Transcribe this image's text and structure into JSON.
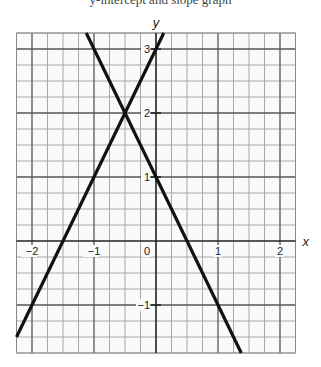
{
  "header": {
    "cutoff_text": "y-intercept and slope graph"
  },
  "chart_data": {
    "type": "line",
    "title": "",
    "xlabel": "x",
    "ylabel": "y",
    "xlim": [
      -2.25,
      2.25
    ],
    "ylim": [
      -1.75,
      3.25
    ],
    "grid": true,
    "grid_minor_step": 0.25,
    "grid_major_step": 1,
    "x_ticks": [
      -2,
      -1,
      0,
      1,
      2
    ],
    "x_tick_labels": [
      "−2",
      "−1",
      "0",
      "1",
      "2"
    ],
    "y_ticks": [
      -1,
      1,
      2,
      3
    ],
    "y_tick_labels": [
      "−1",
      "1",
      "2",
      "3"
    ],
    "series": [
      {
        "name": "y = 2x + 3",
        "slope": 2,
        "intercept": 3,
        "points": [
          [
            -2.25,
            -1.5
          ],
          [
            0.125,
            3.25
          ]
        ]
      },
      {
        "name": "y = −2x + 1",
        "slope": -2,
        "intercept": 1,
        "points": [
          [
            -1.125,
            3.25
          ],
          [
            1.375,
            -1.75
          ]
        ]
      }
    ],
    "intersection": [
      -0.5,
      2
    ]
  }
}
